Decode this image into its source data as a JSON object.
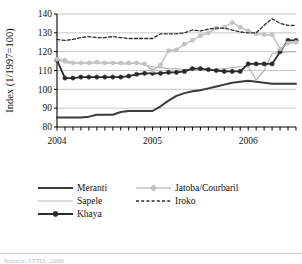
{
  "figure": {
    "background": "#ffffff",
    "axis_color": "#000000",
    "grid_color": "#b0b0b0"
  },
  "chart_data": {
    "type": "line",
    "title": "",
    "xlabel": "",
    "ylabel": "Index (1/1997=100)",
    "ylim": [
      80,
      140
    ],
    "yticks": [
      80,
      90,
      100,
      110,
      120,
      130,
      140
    ],
    "ytick_labels": [
      "80",
      "90",
      "100",
      "110",
      "120",
      "130",
      "140"
    ],
    "xlim": [
      0,
      30
    ],
    "xtick_labels": [
      "2004",
      "2005",
      "2006"
    ],
    "xtick_positions": [
      0,
      12,
      24
    ],
    "x_minor_tick_count": 31,
    "grid": "horizontal",
    "legend_position": "below",
    "x": [
      0,
      1,
      2,
      3,
      4,
      5,
      6,
      7,
      8,
      9,
      10,
      11,
      12,
      13,
      14,
      15,
      16,
      17,
      18,
      19,
      20,
      21,
      22,
      23,
      24,
      25,
      26,
      27,
      28,
      29,
      30
    ],
    "series": [
      {
        "name": "Meranti",
        "color": "#3a3a3a",
        "style": "solid",
        "width": 2.0,
        "marker": "none",
        "values": [
          85,
          85,
          85,
          85,
          85.5,
          86.5,
          86.5,
          86.5,
          88,
          88.5,
          88.5,
          88.5,
          88.5,
          91,
          94,
          96.5,
          98,
          99,
          99.5,
          100.5,
          101.5,
          102.5,
          103.5,
          104,
          104.5,
          104,
          103.5,
          103,
          103,
          103,
          103
        ]
      },
      {
        "name": "Sapele",
        "color": "#b5b5b5",
        "style": "solid",
        "width": 1.2,
        "marker": "none",
        "values": [
          116,
          114,
          114,
          114,
          114,
          114,
          114,
          114,
          113.5,
          113.5,
          114,
          113,
          112,
          111.5,
          111,
          111,
          110.5,
          110.5,
          110,
          110,
          110.5,
          111,
          111.5,
          112,
          112,
          105,
          110,
          119,
          119.5,
          120,
          120
        ]
      },
      {
        "name": "Khaya",
        "color": "#2b2b2b",
        "style": "solid",
        "width": 1.8,
        "marker": "circle",
        "values": [
          115.5,
          106,
          106,
          106.5,
          106.5,
          106.5,
          106.5,
          106.5,
          106.5,
          107,
          108,
          108.5,
          108.5,
          108.5,
          109,
          109,
          109.5,
          111,
          111,
          110.5,
          110,
          109.5,
          109.5,
          109.5,
          113.5,
          113.5,
          113.5,
          113.5,
          120,
          126,
          126
        ]
      },
      {
        "name": "Jatoba/Courbaril",
        "color": "#c2c2c2",
        "style": "solid",
        "width": 1.6,
        "marker": "circle",
        "values": [
          116,
          115.5,
          114,
          114,
          114,
          114.5,
          114,
          114,
          114,
          114,
          114,
          113.5,
          110,
          113,
          120.5,
          121,
          124,
          126,
          128.5,
          130,
          132.5,
          133,
          135.5,
          133,
          131,
          129.5,
          129,
          129,
          121.5,
          124.5,
          125
        ]
      },
      {
        "name": "Iroko",
        "color": "#2b2b2b",
        "style": "dashed",
        "width": 1.3,
        "marker": "none",
        "values": [
          126.5,
          126,
          126.5,
          127.5,
          128,
          127.5,
          127.5,
          128,
          127.5,
          127,
          127,
          127,
          127,
          129.5,
          129.5,
          129.5,
          130,
          131.5,
          131,
          132,
          132.5,
          132.5,
          131.5,
          130.5,
          130,
          130,
          134,
          137.5,
          135,
          134,
          134
        ]
      }
    ]
  },
  "legend": {
    "entries": [
      {
        "label": "Meranti",
        "key": "meranti"
      },
      {
        "label": "Jatoba/Courbaril",
        "key": "jatoba"
      },
      {
        "label": "Sapele",
        "key": "sapele"
      },
      {
        "label": "Iroko",
        "key": "iroko"
      },
      {
        "label": "Khaya",
        "key": "khaya"
      }
    ]
  },
  "footer": {
    "source_note": "Source: ITTO, 2006"
  }
}
